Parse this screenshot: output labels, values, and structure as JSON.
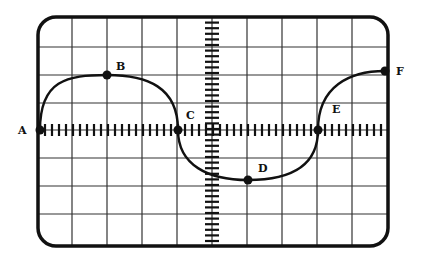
{
  "diagram": {
    "type": "oscilloscope-waveform",
    "colors": {
      "ink": "#111111",
      "grid": "#333333",
      "background": "#ffffff"
    },
    "frame": {
      "left": 38,
      "top": 17,
      "right": 388,
      "bottom": 246,
      "corner_radius": 18
    },
    "grid": {
      "vertical_lines_x": [
        72,
        107,
        142,
        177,
        247,
        282,
        317,
        352
      ],
      "horizontal_lines_y": [
        47,
        75,
        103,
        158,
        186,
        214
      ],
      "center_x": 212,
      "center_y": 130
    },
    "points": [
      {
        "id": "A",
        "label": "A",
        "x": 40,
        "y": 130,
        "label_x": 18,
        "label_y": 134
      },
      {
        "id": "B",
        "label": "B",
        "x": 107,
        "y": 75,
        "label_x": 116,
        "label_y": 70
      },
      {
        "id": "C",
        "label": "C",
        "x": 178,
        "y": 130,
        "label_x": 186,
        "label_y": 119
      },
      {
        "id": "D",
        "label": "D",
        "x": 248,
        "y": 180,
        "label_x": 258,
        "label_y": 172
      },
      {
        "id": "E",
        "label": "E",
        "x": 318,
        "y": 130,
        "label_x": 332,
        "label_y": 113
      },
      {
        "id": "F",
        "label": "F",
        "x": 385,
        "y": 71,
        "label_x": 396,
        "label_y": 75
      }
    ],
    "waveform_description": "Sine-like wave: A (zero crossing) rises to peak B, falls through C (zero crossing) to trough D, rises through E (zero crossing) toward F"
  }
}
